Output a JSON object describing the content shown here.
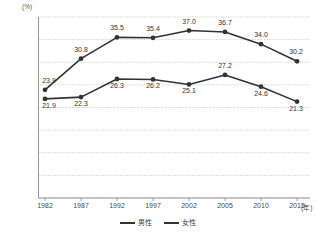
{
  "chart_data": {
    "type": "line",
    "title": "",
    "subtitle": "",
    "xlabel": "(年)",
    "ylabel": "(%)",
    "unit_top_left": "(%)",
    "unit_bottom_right": "(年)",
    "categories": [
      "1982",
      "1987",
      "1992",
      "1997",
      "2002",
      "2005",
      "2010",
      "2015"
    ],
    "ylim": [
      0.0,
      40.0
    ],
    "ytick_step": 5.0,
    "yticks": [
      "0.0",
      "5.0",
      "10.0",
      "15.0",
      "20.0",
      "25.0",
      "30.0",
      "35.0",
      "40.0"
    ],
    "ytick_values": [
      0.0,
      5.0,
      10.0,
      15.0,
      20.0,
      25.0,
      30.0,
      35.0,
      40.0
    ],
    "grid": true,
    "grid_style": "dotted",
    "legend_position": "bottom-center",
    "series": [
      {
        "name": "男性",
        "color": "#333333",
        "marker": "circle",
        "values": [
          21.9,
          22.3,
          26.3,
          26.2,
          25.1,
          27.2,
          24.6,
          21.3
        ],
        "labels": [
          "21.9",
          "22.3",
          "26.3",
          "26.2",
          "25.1",
          "27.2",
          "24.6",
          "21.3"
        ],
        "label_positions": [
          "below",
          "below",
          "below",
          "below",
          "below",
          "above",
          "below",
          "below"
        ]
      },
      {
        "name": "女性",
        "color": "#333333",
        "marker": "circle",
        "values": [
          23.9,
          30.8,
          35.5,
          35.4,
          37.0,
          36.7,
          34.0,
          30.2
        ],
        "labels": [
          "23.9",
          "30.8",
          "35.5",
          "35.4",
          "37.0",
          "36.7",
          "34.0",
          "30.2"
        ],
        "label_positions": [
          "above",
          "above",
          "above",
          "above",
          "above",
          "above",
          "above",
          "above"
        ]
      }
    ]
  },
  "legend": {
    "items": [
      {
        "label": "男性",
        "color": "#333333"
      },
      {
        "label": "女性",
        "color": "#333333"
      }
    ]
  },
  "colors": {
    "line": "#333333",
    "grid": "#b8b8b8",
    "axis": "#8a8a8a",
    "text": "#3a3a3a",
    "background": "#ffffff"
  }
}
